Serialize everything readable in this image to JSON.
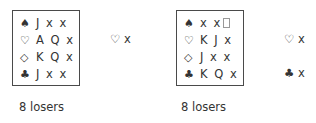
{
  "examples": [
    {
      "hand": [
        {
          "suit": "♠",
          "suit_name": "spades",
          "cards": "J x x"
        },
        {
          "suit": "♡",
          "suit_name": "hearts",
          "cards": "A Q x"
        },
        {
          "suit": "◇",
          "suit_name": "diamonds",
          "cards": "K Q x"
        },
        {
          "suit": "♣",
          "suit_name": "clubs",
          "cards": "J x x"
        }
      ],
      "side_holdings": [
        {
          "suit": "♡",
          "cards": "x"
        }
      ],
      "losers_label": "8 losers"
    },
    {
      "hand": [
        {
          "suit": "♠",
          "suit_name": "spades",
          "cards": "x x"
        },
        {
          "suit": "♡",
          "suit_name": "hearts",
          "cards": "K J x"
        },
        {
          "suit": "◇",
          "suit_name": "diamonds",
          "cards": "J x x"
        },
        {
          "suit": "♣",
          "suit_name": "clubs",
          "cards": "K Q x"
        }
      ],
      "side_holdings": [
        {
          "suit": "♡",
          "cards": "x"
        },
        {
          "suit": "♣",
          "cards": "x"
        }
      ],
      "losers_label": "8 losers"
    }
  ]
}
